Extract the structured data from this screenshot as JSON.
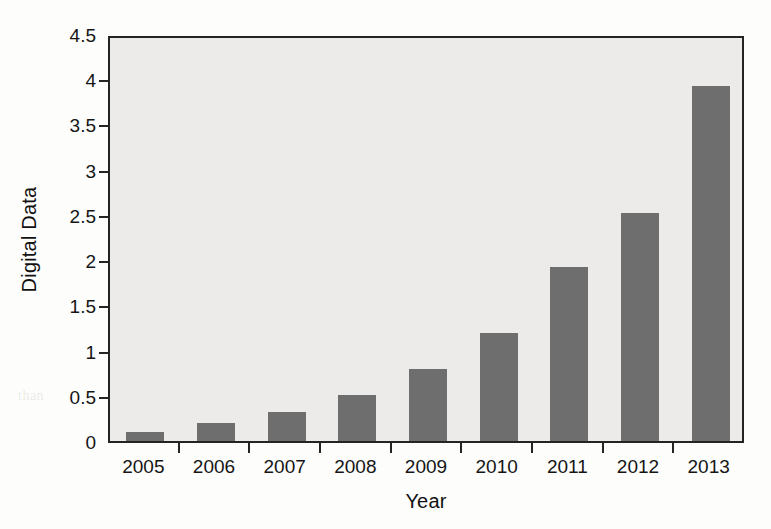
{
  "chart_data": {
    "type": "bar",
    "title": "",
    "xlabel": "Year",
    "ylabel": "Digital Data",
    "categories": [
      "2005",
      "2006",
      "2007",
      "2008",
      "2009",
      "2010",
      "2011",
      "2012",
      "2013"
    ],
    "values": [
      0.1,
      0.2,
      0.32,
      0.51,
      0.8,
      1.19,
      1.92,
      2.52,
      3.92
    ],
    "ylim": [
      0,
      4.5
    ],
    "yticks": [
      0,
      0.5,
      1,
      1.5,
      2,
      2.5,
      3,
      3.5,
      4,
      4.5
    ],
    "ytick_labels": [
      "0",
      "0.5",
      "1",
      "1.5",
      "2",
      "2.5",
      "3",
      "3.5",
      "4",
      "4.5"
    ],
    "grid": false,
    "legend": null,
    "series": [
      {
        "name": "Digital Data",
        "values": [
          0.1,
          0.2,
          0.32,
          0.51,
          0.8,
          1.19,
          1.92,
          2.52,
          3.92
        ]
      }
    ]
  },
  "colors": {
    "bar": "#6e6e6e",
    "plot_background": "#edebe9",
    "axis": "#242424",
    "page_background": "#fdfdfc",
    "text": "#151515"
  },
  "background_bleed": [
    {
      "text": "to obtain a deeper knowledge that the user",
      "x": 212,
      "y": 44,
      "size": 15
    },
    {
      "text": "ters of value, these of information from major three",
      "x": 200,
      "y": 70,
      "size": 15
    },
    {
      "text": "Machine Learning Analytics",
      "x": 238,
      "y": 140,
      "size": 17
    },
    {
      "text": "arning systems, data are used to develop and",
      "x": 208,
      "y": 176,
      "size": 15
    },
    {
      "text": "The machine learning gives the option",
      "x": 222,
      "y": 200,
      "size": 15
    },
    {
      "text": "2.5",
      "x": 212,
      "y": 228,
      "size": 14
    },
    {
      "text": "with the information that can also be",
      "x": 228,
      "y": 262,
      "size": 15
    },
    {
      "text": "1.3",
      "x": 206,
      "y": 290,
      "size": 14
    },
    {
      "text": "more intelligent in a system, the",
      "x": 240,
      "y": 320,
      "size": 15
    },
    {
      "text": "than",
      "x": 18,
      "y": 388,
      "size": 14
    }
  ]
}
